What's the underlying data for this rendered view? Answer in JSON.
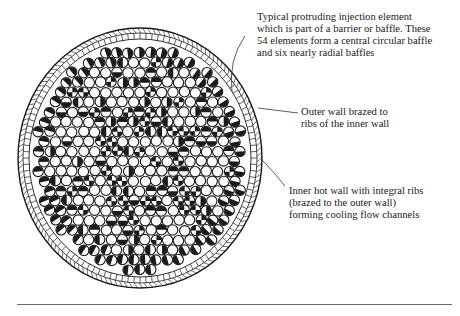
{
  "figure": {
    "element_count_in_baffles": 54,
    "radial_baffle_count": 6,
    "annotations": [
      {
        "id": "element",
        "text": "Typical protruding injection element\nwhich is part of a barrier or baffle. These\n54 elements form a central circular baffle\nand six nearly radial baffles"
      },
      {
        "id": "outer",
        "text": "Outer wall brazed to\nribs of the inner wall"
      },
      {
        "id": "inner",
        "text": "Inner hot wall with integral ribs\n(brazed to the outer wall)\nforming cooling flow channels"
      }
    ]
  },
  "colors": {
    "ink": "#1a1a1a",
    "paper": "#ffffff",
    "rule": "#6a6a6a"
  }
}
